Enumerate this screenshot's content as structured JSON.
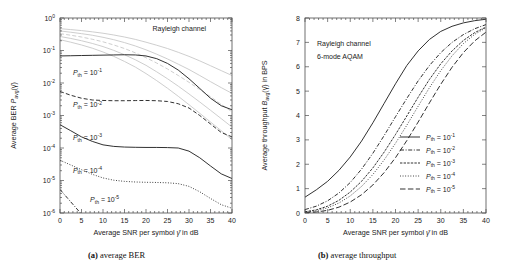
{
  "figure": {
    "caption_a_tag": "(a)",
    "caption_a_text": " average BER",
    "caption_b_tag": "(b)",
    "caption_b_text": " average throughput"
  },
  "chart_data": [
    {
      "id": "panel-a",
      "type": "line",
      "title": "",
      "annotations": [
        "Rayleigh channel"
      ],
      "xlabel_parts": [
        "Average SNR per symbol ",
        "γ̄",
        " in dB"
      ],
      "xlabel": "Average SNR per symbol γ̄ in dB",
      "ylabel_parts": [
        "Average BER ",
        "P",
        "avg",
        "(γ̄)"
      ],
      "ylabel": "Average BER P_avg(γ̄)",
      "xlim": [
        0,
        40
      ],
      "ylim": [
        1e-06,
        1
      ],
      "yscale": "log",
      "xticks": [
        0,
        5,
        10,
        15,
        20,
        25,
        30,
        35,
        40
      ],
      "xticklabels": [
        "0",
        "5",
        "10",
        "15",
        "20",
        "25",
        "30",
        "35",
        "40"
      ],
      "yticks": [
        1,
        0.1,
        0.01,
        0.001,
        0.0001,
        1e-05,
        1e-06
      ],
      "yticklabels": [
        "10^0",
        "10^-1",
        "10^-2",
        "10^-3",
        "10^-4",
        "10^-5",
        "10^-6"
      ],
      "grid": false,
      "legend_position": "inline-labels",
      "x": [
        0,
        2.5,
        5,
        7.5,
        10,
        12.5,
        15,
        17.5,
        20,
        22.5,
        25,
        27.5,
        30,
        32.5,
        35,
        37.5,
        40
      ],
      "series": [
        {
          "name": "P_th = 10^-1",
          "label_parts": [
            "P",
            "th",
            "= 10",
            "-1"
          ],
          "style": "solid",
          "color": "#262626",
          "label_x": 3.0,
          "label_y": 0.018,
          "values": [
            0.068,
            0.069,
            0.07,
            0.071,
            0.072,
            0.073,
            0.074,
            0.073,
            0.068,
            0.056,
            0.04,
            0.025,
            0.0135,
            0.0068,
            0.0034,
            0.002,
            0.0015
          ]
        },
        {
          "name": "P_th = 10^-2",
          "label_parts": [
            "P",
            "th",
            "= 10",
            "-2"
          ],
          "style": "dashed",
          "color": "#262626",
          "label_x": 3.0,
          "label_y": 0.0018,
          "values": [
            0.0055,
            0.0042,
            0.0034,
            0.003,
            0.0029,
            0.00285,
            0.00285,
            0.00288,
            0.0029,
            0.00285,
            0.0027,
            0.0023,
            0.0017,
            0.001,
            0.00055,
            0.0003,
            0.00022
          ]
        },
        {
          "name": "P_th = 10^-3",
          "label_parts": [
            "P",
            "th",
            "= 10",
            "-3"
          ],
          "style": "solid",
          "color": "#262626",
          "label_x": 3.0,
          "label_y": 0.00018,
          "values": [
            0.00052,
            0.00034,
            0.00022,
            0.00016,
            0.000125,
            0.000112,
            0.000107,
            0.000105,
            0.000104,
            0.000104,
            0.000103,
            0.0001,
            8e-05,
            5e-05,
            2.8e-05,
            1.6e-05,
            1.15e-05
          ]
        },
        {
          "name": "P_th = 10^-4",
          "label_parts": [
            "P",
            "th",
            "= 10",
            "-4"
          ],
          "style": "dotted",
          "color": "#262626",
          "label_x": 3.0,
          "label_y": 1.75e-05,
          "values": [
            4.2e-05,
            3e-05,
            2.15e-05,
            1.55e-05,
            1.2e-05,
            1.02e-05,
            9.4e-06,
            9e-06,
            8.8e-06,
            8.7e-06,
            8.5e-06,
            8e-06,
            6.6e-06,
            4.5e-06,
            2.8e-06,
            1.8e-06,
            1.4e-06
          ]
        },
        {
          "name": "P_th = 10^-5",
          "label_parts": [
            "P",
            "th",
            "= 10",
            "-5"
          ],
          "style": "dashdot",
          "color": "#262626",
          "label_x": 7.0,
          "label_y": 2.2e-06,
          "values": [
            5.3e-06,
            2.2e-06,
            9.2e-07,
            3.8e-07,
            1.6e-07,
            7e-08,
            3e-08,
            null,
            null,
            null,
            null,
            null,
            null,
            null,
            null,
            null,
            null
          ]
        }
      ],
      "reference_series": [
        {
          "name": "fixed-mode-1",
          "style": "solid",
          "color": "#c8c8c8",
          "values": [
            0.47,
            0.44,
            0.41,
            0.375,
            0.34,
            0.3,
            0.26,
            0.22,
            0.18,
            0.145,
            0.115,
            0.088,
            0.066,
            0.048,
            0.034,
            0.024,
            0.017
          ]
        },
        {
          "name": "fixed-mode-2",
          "style": "solid",
          "color": "#c8c8c8",
          "values": [
            0.4,
            0.365,
            0.33,
            0.295,
            0.255,
            0.215,
            0.175,
            0.138,
            0.105,
            0.077,
            0.055,
            0.038,
            0.026,
            0.017,
            0.011,
            0.0072,
            0.0048
          ]
        },
        {
          "name": "fixed-mode-3",
          "style": "dashed",
          "color": "#c8c8c8",
          "values": [
            0.33,
            0.295,
            0.26,
            0.222,
            0.185,
            0.148,
            0.115,
            0.085,
            0.06,
            0.041,
            0.027,
            0.017,
            0.0105,
            0.0063,
            0.0038,
            0.0022,
            0.0013
          ]
        },
        {
          "name": "fixed-mode-4",
          "style": "solid",
          "color": "#c8c8c8",
          "values": [
            0.27,
            0.235,
            0.2,
            0.165,
            0.132,
            0.101,
            0.074,
            0.052,
            0.035,
            0.022,
            0.0135,
            0.008,
            0.0046,
            0.0026,
            0.00145,
            0.0008,
            0.00044
          ]
        },
        {
          "name": "fixed-mode-5",
          "style": "solid",
          "color": "#c8c8c8",
          "values": [
            0.215,
            0.18,
            0.148,
            0.118,
            0.09,
            0.066,
            0.046,
            0.031,
            0.0195,
            0.0118,
            0.0069,
            0.0039,
            0.00215,
            0.00117,
            0.00063,
            0.00034,
            0.00018
          ]
        }
      ]
    },
    {
      "id": "panel-b",
      "type": "line",
      "title": "",
      "annotations": [
        "Rayleigh channel",
        "6-mode AQAM"
      ],
      "xlabel_parts": [
        "Average SNR per symbol ",
        "γ̄",
        " in dB"
      ],
      "xlabel": "Average SNR per symbol γ̄ in dB",
      "ylabel_parts": [
        "Average throughput ",
        "B",
        "avg",
        "(γ̄) in BPS"
      ],
      "ylabel": "Average throughput B_avg(γ̄) in BPS",
      "xlim": [
        0,
        40
      ],
      "ylim": [
        0,
        8
      ],
      "yscale": "linear",
      "xticks": [
        0,
        5,
        10,
        15,
        20,
        25,
        30,
        35,
        40
      ],
      "xticklabels": [
        "0",
        "5",
        "10",
        "15",
        "20",
        "25",
        "30",
        "35",
        "40"
      ],
      "yticks": [
        0,
        1,
        2,
        3,
        4,
        5,
        6,
        7,
        8
      ],
      "yticklabels": [
        "0",
        "1",
        "2",
        "3",
        "4",
        "5",
        "6",
        "7",
        "8"
      ],
      "grid": false,
      "legend_position": "lower-right",
      "x": [
        0,
        2.5,
        5,
        7.5,
        10,
        12.5,
        15,
        17.5,
        20,
        22.5,
        25,
        27.5,
        30,
        32.5,
        35,
        37.5,
        40
      ],
      "series": [
        {
          "name": "P_th = 10^-1",
          "label_parts": [
            "P",
            "th",
            "= 10",
            "-1"
          ],
          "style": "solid",
          "color": "#262626",
          "values": [
            0.65,
            0.95,
            1.3,
            1.75,
            2.3,
            2.95,
            3.7,
            4.5,
            5.3,
            6.05,
            6.65,
            7.12,
            7.45,
            7.66,
            7.8,
            7.89,
            7.95
          ]
        },
        {
          "name": "P_th = 10^-2",
          "label_parts": [
            "P",
            "th",
            "= 10",
            "-2"
          ],
          "style": "dashdot",
          "color": "#262626",
          "values": [
            0.14,
            0.28,
            0.5,
            0.82,
            1.25,
            1.8,
            2.45,
            3.18,
            3.95,
            4.7,
            5.42,
            6.05,
            6.58,
            7.0,
            7.32,
            7.56,
            7.73
          ]
        },
        {
          "name": "P_th = 10^-3",
          "label_parts": [
            "P",
            "th",
            "= 10",
            "-3"
          ],
          "style": "densedash",
          "color": "#262626",
          "values": [
            0.05,
            0.13,
            0.28,
            0.52,
            0.86,
            1.3,
            1.85,
            2.5,
            3.22,
            3.98,
            4.75,
            5.48,
            6.12,
            6.65,
            7.08,
            7.4,
            7.63
          ]
        },
        {
          "name": "P_th = 10^-4",
          "label_parts": [
            "P",
            "th",
            "= 10",
            "-4"
          ],
          "style": "dotted",
          "color": "#262626",
          "values": [
            0.03,
            0.09,
            0.21,
            0.41,
            0.7,
            1.09,
            1.58,
            2.18,
            2.86,
            3.6,
            4.38,
            5.14,
            5.84,
            6.45,
            6.95,
            7.33,
            7.6
          ]
        },
        {
          "name": "P_th = 10^-5",
          "label_parts": [
            "P",
            "th",
            "= 10",
            "-5"
          ],
          "style": "longdash",
          "color": "#262626",
          "values": [
            0.01,
            0.04,
            0.11,
            0.24,
            0.45,
            0.75,
            1.15,
            1.66,
            2.27,
            2.97,
            3.73,
            4.52,
            5.28,
            5.98,
            6.58,
            7.06,
            7.42
          ]
        }
      ]
    }
  ]
}
